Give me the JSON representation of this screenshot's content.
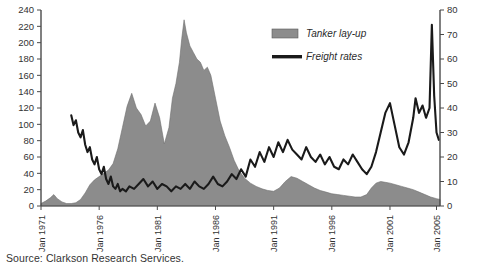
{
  "source": {
    "text": "Source: Clarkson Research Services."
  },
  "legend": {
    "items": [
      {
        "label": "Tanker lay-up",
        "type": "area",
        "color": "#8c8c8c"
      },
      {
        "label": "Freight rates",
        "type": "line",
        "color": "#1a1a1a"
      }
    ]
  },
  "chart_data": {
    "type": "area",
    "title": "",
    "subtitle": "",
    "xlabel": "",
    "ylabel": "",
    "grid": false,
    "legend_position": "top-right",
    "axes": {
      "left": {
        "label": "",
        "ylim": [
          0,
          240
        ],
        "ticks": [
          0,
          20,
          40,
          60,
          80,
          100,
          120,
          140,
          160,
          180,
          200,
          220,
          240
        ],
        "tick_labels": [
          "0",
          "20",
          "40",
          "60",
          "80",
          "100",
          "120",
          "140",
          "160",
          "180",
          "200",
          "220",
          "240"
        ],
        "series": "Tanker lay-up"
      },
      "right": {
        "label": "",
        "ylim": [
          0,
          80
        ],
        "ticks": [
          0,
          10,
          20,
          30,
          40,
          50,
          60,
          70,
          80
        ],
        "tick_labels": [
          "0",
          "10",
          "20",
          "30",
          "40",
          "50",
          "60",
          "70",
          "80"
        ],
        "series": "Freight rates"
      },
      "x": {
        "ticks": [
          1971,
          1976,
          1981,
          1986,
          1991,
          1996,
          2001,
          2005
        ],
        "tick_labels": [
          "Jan 1971",
          "Jan 1976",
          "Jan 1981",
          "Jan 1986",
          "Jan 1991",
          "Jan 1996",
          "Jan 2001",
          "Jan 2005"
        ],
        "xlim": [
          1971,
          2005.3
        ]
      }
    },
    "series": [
      {
        "name": "Tanker lay-up",
        "axis": "left",
        "type": "area",
        "color": "#8c8c8c",
        "x": [
          1971.0,
          1971.4,
          1971.8,
          1972.1,
          1972.4,
          1972.8,
          1973.2,
          1973.6,
          1974.0,
          1974.4,
          1974.8,
          1975.2,
          1975.6,
          1976.0,
          1976.4,
          1976.8,
          1977.2,
          1977.6,
          1978.0,
          1978.4,
          1978.8,
          1979.2,
          1979.6,
          1980.0,
          1980.4,
          1980.8,
          1981.2,
          1981.6,
          1982.0,
          1982.3,
          1982.6,
          1982.9,
          1983.1,
          1983.3,
          1983.5,
          1983.8,
          1984.1,
          1984.4,
          1984.7,
          1985.0,
          1985.3,
          1985.6,
          1986.0,
          1986.4,
          1986.8,
          1987.2,
          1987.6,
          1988.0,
          1988.5,
          1989.0,
          1989.5,
          1990.0,
          1990.5,
          1991.0,
          1991.5,
          1992.0,
          1992.5,
          1993.0,
          1993.5,
          1994.0,
          1994.5,
          1995.0,
          1995.5,
          1996.0,
          1996.5,
          1997.0,
          1997.5,
          1998.0,
          1998.5,
          1999.0,
          1999.4,
          1999.8,
          2000.2,
          2000.6,
          2001.0,
          2001.5,
          2002.0,
          2002.5,
          2003.0,
          2003.5,
          2004.0,
          2004.5,
          2005.0,
          2005.3
        ],
        "y": [
          3,
          6,
          10,
          14,
          9,
          5,
          3,
          3,
          4,
          8,
          16,
          26,
          32,
          36,
          40,
          44,
          52,
          70,
          96,
          122,
          138,
          120,
          112,
          98,
          104,
          126,
          108,
          76,
          96,
          132,
          150,
          176,
          205,
          228,
          212,
          196,
          188,
          180,
          176,
          166,
          170,
          160,
          132,
          104,
          86,
          72,
          56,
          44,
          34,
          28,
          24,
          21,
          19,
          18,
          22,
          30,
          36,
          34,
          30,
          26,
          22,
          19,
          17,
          15,
          14,
          13,
          12,
          11,
          11,
          14,
          22,
          28,
          30,
          29,
          28,
          26,
          24,
          22,
          20,
          17,
          14,
          11,
          9,
          8
        ]
      },
      {
        "name": "Freight rates",
        "axis": "right",
        "type": "line",
        "color": "#1a1a1a",
        "x": [
          1973.6,
          1973.8,
          1974.0,
          1974.2,
          1974.4,
          1974.6,
          1974.8,
          1975.0,
          1975.2,
          1975.4,
          1975.6,
          1975.8,
          1976.0,
          1976.2,
          1976.4,
          1976.6,
          1976.8,
          1977.0,
          1977.2,
          1977.4,
          1977.6,
          1977.8,
          1978.0,
          1978.3,
          1978.6,
          1979.0,
          1979.4,
          1979.8,
          1980.2,
          1980.6,
          1981.0,
          1981.4,
          1981.8,
          1982.2,
          1982.6,
          1983.0,
          1983.4,
          1983.8,
          1984.2,
          1984.6,
          1985.0,
          1985.4,
          1985.8,
          1986.2,
          1986.6,
          1987.0,
          1987.4,
          1987.8,
          1988.2,
          1988.6,
          1989.0,
          1989.4,
          1989.8,
          1990.2,
          1990.6,
          1991.0,
          1991.4,
          1991.8,
          1992.2,
          1992.6,
          1993.0,
          1993.4,
          1993.8,
          1994.2,
          1994.6,
          1995.0,
          1995.4,
          1995.8,
          1996.2,
          1996.6,
          1997.0,
          1997.4,
          1997.8,
          1998.2,
          1998.6,
          1999.0,
          1999.4,
          1999.8,
          2000.2,
          2000.6,
          2001.0,
          2001.4,
          2001.8,
          2002.2,
          2002.6,
          2003.0,
          2003.2,
          2003.5,
          2003.8,
          2004.1,
          2004.4,
          2004.6,
          2004.8,
          2005.0,
          2005.2
        ],
        "y": [
          37,
          33,
          35,
          30,
          28,
          31,
          25,
          22,
          24,
          19,
          17,
          20,
          15,
          13,
          16,
          11,
          9,
          12,
          8,
          7,
          9,
          6,
          7,
          6,
          8,
          7,
          9,
          11,
          8,
          10,
          7,
          9,
          8,
          6,
          8,
          7,
          9,
          7,
          10,
          8,
          7,
          9,
          12,
          9,
          8,
          10,
          13,
          11,
          15,
          12,
          19,
          16,
          22,
          18,
          24,
          20,
          26,
          22,
          27,
          23,
          21,
          19,
          24,
          20,
          18,
          21,
          17,
          20,
          16,
          15,
          19,
          17,
          21,
          18,
          15,
          13,
          16,
          22,
          30,
          38,
          42,
          33,
          24,
          21,
          26,
          36,
          44,
          38,
          41,
          36,
          40,
          74,
          45,
          30,
          27
        ]
      }
    ]
  }
}
